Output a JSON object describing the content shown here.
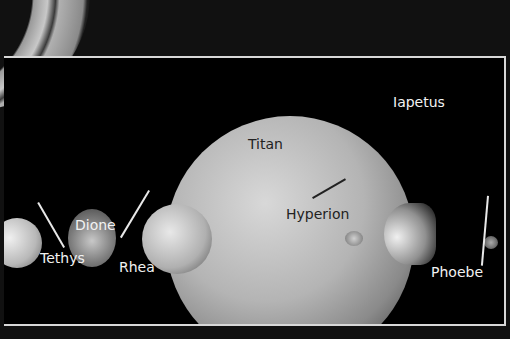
{
  "figure": {
    "labels": {
      "tethys": "Tethys",
      "dione": "Dione",
      "rhea": "Rhea",
      "titan": "Titan",
      "hyperion": "Hyperion",
      "iapetus": "Iapetus",
      "phoebe": "Phoebe"
    }
  }
}
